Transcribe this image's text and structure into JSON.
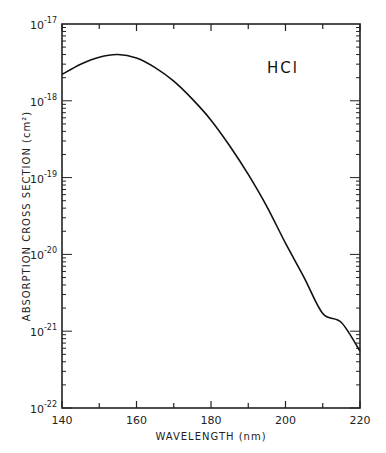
{
  "chart_data": {
    "type": "line",
    "title": "",
    "annotation": "HCl",
    "xlabel": "WAVELENGTH (nm)",
    "ylabel": "ABSORPTION CROSS SECTION (cm²)",
    "xlim": [
      140,
      220
    ],
    "ylim": [
      1e-22,
      1e-17
    ],
    "yscale": "log",
    "x_ticks": [
      "140",
      "160",
      "180",
      "200",
      "220"
    ],
    "y_ticks": [
      {
        "base": "10",
        "exp": "-17"
      },
      {
        "base": "10",
        "exp": "-18"
      },
      {
        "base": "10",
        "exp": "-19"
      },
      {
        "base": "10",
        "exp": "-20"
      },
      {
        "base": "10",
        "exp": "-21"
      },
      {
        "base": "10",
        "exp": "-22"
      }
    ],
    "grid": false,
    "series": [
      {
        "name": "HCl",
        "x": [
          140,
          145,
          150,
          155,
          160,
          165,
          170,
          175,
          180,
          185,
          190,
          195,
          200,
          205,
          210,
          215,
          220
        ],
        "y": [
          2.2e-18,
          3e-18,
          3.7e-18,
          4e-18,
          3.6e-18,
          2.7e-18,
          1.8e-18,
          1.05e-18,
          5.6e-19,
          2.6e-19,
          1.1e-19,
          4.2e-20,
          1.4e-20,
          5e-21,
          1.7e-21,
          1.3e-21,
          5.5e-22
        ]
      }
    ]
  }
}
